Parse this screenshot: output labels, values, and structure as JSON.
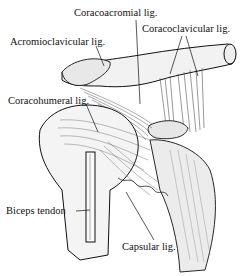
{
  "figure": {
    "labels": [
      {
        "id": "coracoacromial",
        "text": "Coracoacromial lig.",
        "x": 74,
        "y": 13
      },
      {
        "id": "coracoclavicular",
        "text": "Coracoclavicular lig.",
        "x": 142,
        "y": 27
      },
      {
        "id": "acromioclavicular",
        "text": "Acromioclavicular lig.",
        "x": 10,
        "y": 38
      },
      {
        "id": "coracohumeral",
        "text": "Coracohumeral lig.",
        "x": 8,
        "y": 97
      },
      {
        "id": "biceps_tendon",
        "text": "Biceps tendon",
        "x": 6,
        "y": 206
      },
      {
        "id": "capsular",
        "text": "Capsular lig.",
        "x": 122,
        "y": 242
      }
    ],
    "colors": {
      "ink": "#111111",
      "background": "#ffffff",
      "shade": "#d8d8d8"
    }
  }
}
